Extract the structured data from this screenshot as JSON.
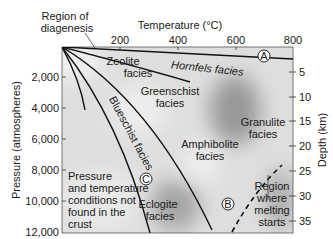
{
  "title_top_left": [
    "Region of",
    "diagenesis"
  ],
  "x_axis": {
    "label": "Temperature (°C)",
    "ticks": [
      "200",
      "400",
      "600",
      "800"
    ]
  },
  "y_axis_left": {
    "label": "Pressure (atmospheres)",
    "ticks": [
      "2,000",
      "4,000",
      "6,000",
      "8,000",
      "10,000",
      "12,000"
    ]
  },
  "y_axis_right": {
    "label": "Depth (km)",
    "ticks": [
      "5",
      "10",
      "15",
      "20",
      "25",
      "30",
      "35"
    ]
  },
  "facies": {
    "zeolite": [
      "Zeolite",
      "facies"
    ],
    "hornfels": "Hornfels facies",
    "greenschist": [
      "Greenschist",
      "facies"
    ],
    "blueschist": "Blueschist facies",
    "amphibolite": [
      "Amphibolite",
      "facies"
    ],
    "granulite": [
      "Granulite",
      "facies"
    ],
    "eclogite": [
      "Eclogite",
      "facies"
    ]
  },
  "annotations": {
    "not_found": [
      "Pressure",
      "and temperature",
      "conditions not",
      "found in the",
      "crust"
    ],
    "melting": [
      "Region",
      "where",
      "melting",
      "starts"
    ]
  },
  "markers": {
    "a": "A",
    "b": "B",
    "c": "C"
  },
  "colors": {
    "line": "#111111",
    "bg_light": "#e6e6e6",
    "bg_dark": "#9a9a9a"
  }
}
